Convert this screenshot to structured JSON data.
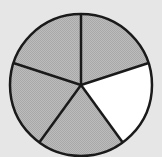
{
  "diagram": {
    "type": "fraction-circle",
    "total_parts": 5,
    "shaded_parts": 4,
    "unshaded_parts": 1,
    "colors": {
      "background": "#e6e6e6",
      "shaded": "#b5b5b5",
      "unshaded": "#ffffff",
      "stroke": "#1a1a1a"
    },
    "slices": [
      {
        "index": 0,
        "shaded": true
      },
      {
        "index": 1,
        "shaded": false
      },
      {
        "index": 2,
        "shaded": true
      },
      {
        "index": 3,
        "shaded": true
      },
      {
        "index": 4,
        "shaded": true
      }
    ]
  }
}
